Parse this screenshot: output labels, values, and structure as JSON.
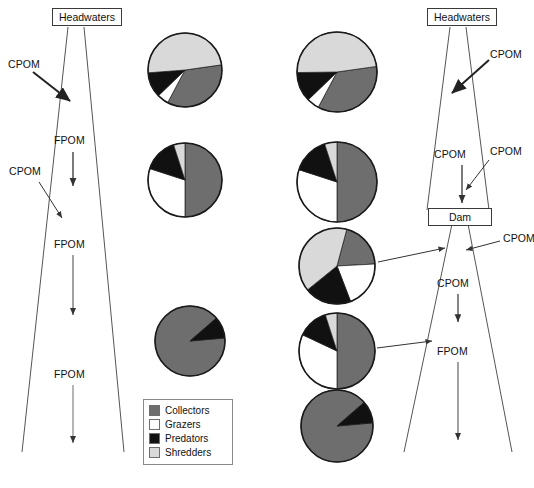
{
  "figure": {
    "background_color": "#ffffff"
  },
  "colors": {
    "collectors": "#6e6e6e",
    "grazers": "#ffffff",
    "predators": "#111111",
    "shredders": "#d9d9d9",
    "outline": "#1a1a1a",
    "river_line": "#555555",
    "arrow": "#222222",
    "box_border": "#3a3a3a",
    "text": "#111111"
  },
  "legend": {
    "name": "functional-feeding-groups-legend",
    "items": [
      {
        "label": "Collectors",
        "color": "#6e6e6e"
      },
      {
        "label": "Grazers",
        "color": "#ffffff"
      },
      {
        "label": "Predators",
        "color": "#111111"
      },
      {
        "label": "Shredders",
        "color": "#d9d9d9"
      }
    ]
  },
  "left_panel": {
    "name": "undammed-river-panel",
    "headwaters_label": "Headwaters",
    "flow_labels": [
      {
        "text": "CPOM",
        "kind": "coarse-particulate-organic-matter"
      },
      {
        "text": "FPOM",
        "kind": "fine-particulate-organic-matter"
      },
      {
        "text": "CPOM",
        "kind": "coarse-particulate-organic-matter"
      },
      {
        "text": "FPOM",
        "kind": "fine-particulate-organic-matter"
      },
      {
        "text": "FPOM",
        "kind": "fine-particulate-organic-matter"
      }
    ]
  },
  "right_panel": {
    "name": "dammed-river-panel",
    "headwaters_label": "Headwaters",
    "dam_label": "Dam",
    "flow_labels": [
      {
        "text": "CPOM",
        "kind": "coarse-particulate-organic-matter"
      },
      {
        "text": "CPOM",
        "kind": "coarse-particulate-organic-matter"
      },
      {
        "text": "CPOM",
        "kind": "coarse-particulate-organic-matter"
      },
      {
        "text": "CPOM",
        "kind": "coarse-particulate-organic-matter"
      },
      {
        "text": "CPOM",
        "kind": "coarse-particulate-organic-matter"
      },
      {
        "text": "FPOM",
        "kind": "fine-particulate-organic-matter"
      }
    ]
  },
  "chart_data": {
    "type": "pie",
    "legend_position": "bottom-left",
    "categories": [
      "Collectors",
      "Grazers",
      "Predators",
      "Shredders"
    ],
    "category_colors": [
      "#6e6e6e",
      "#ffffff",
      "#111111",
      "#d9d9d9"
    ],
    "charts": [
      {
        "id": "left-pie-headwaters",
        "column": "undammed",
        "position": "headwaters",
        "center": [
          185,
          70
        ],
        "radius": 37,
        "values": [
          35,
          5,
          11,
          49
        ],
        "start_angle": -8
      },
      {
        "id": "left-pie-midreach",
        "column": "undammed",
        "position": "mid-reach",
        "center": [
          185,
          180
        ],
        "radius": 37,
        "values": [
          50,
          30,
          15,
          5
        ],
        "start_angle": -90
      },
      {
        "id": "left-pie-lowerreach",
        "column": "undammed",
        "position": "lower-reach",
        "center": [
          190,
          341
        ],
        "radius": 35,
        "values": [
          90,
          0,
          10,
          0
        ],
        "start_angle": -5
      },
      {
        "id": "middle-pie-headwaters",
        "column": "dammed",
        "position": "headwaters",
        "center": [
          337,
          72
        ],
        "radius": 40,
        "values": [
          35,
          5,
          12,
          48
        ],
        "start_angle": -8
      },
      {
        "id": "middle-pie-above-dam",
        "column": "dammed",
        "position": "above-dam",
        "center": [
          337,
          182
        ],
        "radius": 40,
        "values": [
          50,
          30,
          15,
          5
        ],
        "start_angle": -90
      },
      {
        "id": "middle-pie-below-dam",
        "column": "dammed",
        "position": "below-dam-upper",
        "center": [
          337,
          266
        ],
        "radius": 38,
        "values": [
          20,
          20,
          20,
          40
        ],
        "start_angle": -75
      },
      {
        "id": "middle-pie-below-dam-lower",
        "column": "dammed",
        "position": "below-dam-lower",
        "center": [
          337,
          351
        ],
        "radius": 38,
        "values": [
          50,
          32,
          13,
          5
        ],
        "start_angle": -90
      },
      {
        "id": "middle-pie-downstream",
        "column": "dammed",
        "position": "downstream",
        "center": [
          337,
          426
        ],
        "radius": 36,
        "values": [
          90,
          0,
          10,
          0
        ],
        "start_angle": -5
      }
    ]
  }
}
